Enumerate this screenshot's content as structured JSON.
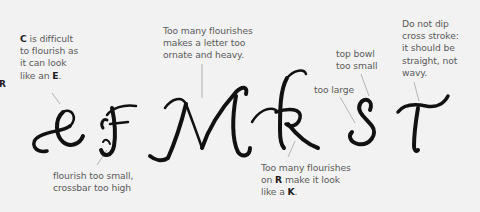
{
  "edge_letter": "R",
  "annotations": {
    "c_note": {
      "lead": "C",
      "line1_rest": " is difficult",
      "line2": "to flourish as",
      "line3": "it can look",
      "line4_pre": "like an ",
      "line4_bold": "E",
      "line4_post": "."
    },
    "f_note": {
      "line1": "flourish too small,",
      "line2": "crossbar too high"
    },
    "m_note": {
      "line1": "Too many flourishes",
      "line2": "makes a letter too",
      "line3": "ornate and heavy."
    },
    "r_note": {
      "line1": "Too many flourishes",
      "line2_pre": "on ",
      "line2_bold": "R",
      "line2_post": " make it look",
      "line3_pre": "like a ",
      "line3_bold": "K",
      "line3_post": "."
    },
    "s_large_note": {
      "line1": "too large"
    },
    "s_bowl_note": {
      "line1": "top bowl",
      "line2": "too small"
    },
    "t_note": {
      "line1": "Do not dip",
      "line2": "cross stroke:",
      "line3": "it should be",
      "line4": "straight, not",
      "line5": "wavy."
    }
  },
  "letters": [
    "C",
    "F",
    "M",
    "R",
    "S",
    "T"
  ],
  "colors": {
    "background": "#f2f2f2",
    "ink": "#111111",
    "annotation_text": "#5a5a5a",
    "leader_line": "#9a9a9a"
  }
}
